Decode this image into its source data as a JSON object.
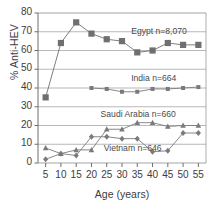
{
  "chart_data": {
    "type": "line",
    "title": "",
    "xlabel": "Age (years)",
    "ylabel": "% Anti-HEV",
    "x": [
      5,
      10,
      15,
      20,
      25,
      30,
      35,
      40,
      45,
      50,
      55
    ],
    "xlim": [
      2.5,
      57.5
    ],
    "ylim": [
      0,
      80
    ],
    "xticks": [
      "5",
      "10",
      "15",
      "20",
      "25",
      "30",
      "35",
      "40",
      "45",
      "50",
      "55"
    ],
    "yticks": [
      "0",
      "10",
      "20",
      "30",
      "40",
      "50",
      "60",
      "70",
      "80"
    ],
    "grid": "horizontal",
    "legend": "inline-annotations",
    "series": [
      {
        "name": "Egypt",
        "label": "Egypt n=8,070",
        "n": "8,070",
        "marker": "square-large",
        "color": "#6f6f6f",
        "x": [
          5,
          10,
          15,
          20,
          25,
          30,
          35,
          40,
          45,
          50,
          55
        ],
        "values": [
          35,
          64,
          75,
          69,
          66,
          65,
          59,
          60,
          64,
          63,
          63
        ]
      },
      {
        "name": "India",
        "label": "India n=664",
        "n": "664",
        "marker": "square-small",
        "color": "#7a7a7a",
        "x": [
          20,
          25,
          30,
          35,
          40,
          45,
          50,
          55
        ],
        "values": [
          40,
          39.5,
          38,
          38,
          39.5,
          39.5,
          40,
          40.5
        ]
      },
      {
        "name": "Saudi Arabia",
        "label": "Saudi Arabia n=660",
        "n": "660",
        "marker": "triangle",
        "color": "#7a7a7a",
        "x": [
          5,
          10,
          15,
          20,
          25,
          30,
          35,
          40,
          45,
          50,
          55
        ],
        "values": [
          8,
          5,
          7,
          7,
          18,
          18,
          21.5,
          21.5,
          19.5,
          20,
          20
        ]
      },
      {
        "name": "Vietnam",
        "label": "Vietnam n=646",
        "n": "646",
        "marker": "diamond",
        "color": "#7a7a7a",
        "x": [
          5,
          10,
          15,
          20,
          25,
          30,
          35,
          40,
          45,
          50,
          55
        ],
        "values": [
          2,
          5,
          4,
          14,
          14,
          13,
          13,
          6,
          6.5,
          16,
          16
        ]
      }
    ],
    "annotations": [
      {
        "text": "Egypt n=8,070",
        "x": 33,
        "y": 70
      },
      {
        "text": "India n=664",
        "x": 33,
        "y": 45
      },
      {
        "text": "Saudi Arabia n=660",
        "x": 23,
        "y": 25.5
      },
      {
        "text": "Vietnam n=646",
        "x": 24,
        "y": 7.5
      }
    ]
  }
}
